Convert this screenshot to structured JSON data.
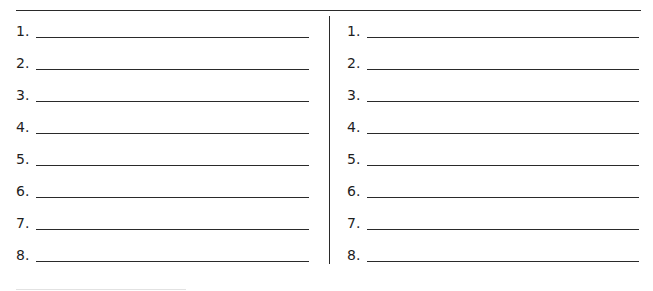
{
  "worksheet": {
    "left_column": {
      "items": [
        {
          "number": "1.",
          "answer": ""
        },
        {
          "number": "2.",
          "answer": ""
        },
        {
          "number": "3.",
          "answer": ""
        },
        {
          "number": "4.",
          "answer": ""
        },
        {
          "number": "5.",
          "answer": ""
        },
        {
          "number": "6.",
          "answer": ""
        },
        {
          "number": "7.",
          "answer": ""
        },
        {
          "number": "8.",
          "answer": ""
        }
      ]
    },
    "right_column": {
      "items": [
        {
          "number": "1.",
          "answer": ""
        },
        {
          "number": "2.",
          "answer": ""
        },
        {
          "number": "3.",
          "answer": ""
        },
        {
          "number": "4.",
          "answer": ""
        },
        {
          "number": "5.",
          "answer": ""
        },
        {
          "number": "6.",
          "answer": ""
        },
        {
          "number": "7.",
          "answer": ""
        },
        {
          "number": "8.",
          "answer": ""
        }
      ]
    }
  }
}
